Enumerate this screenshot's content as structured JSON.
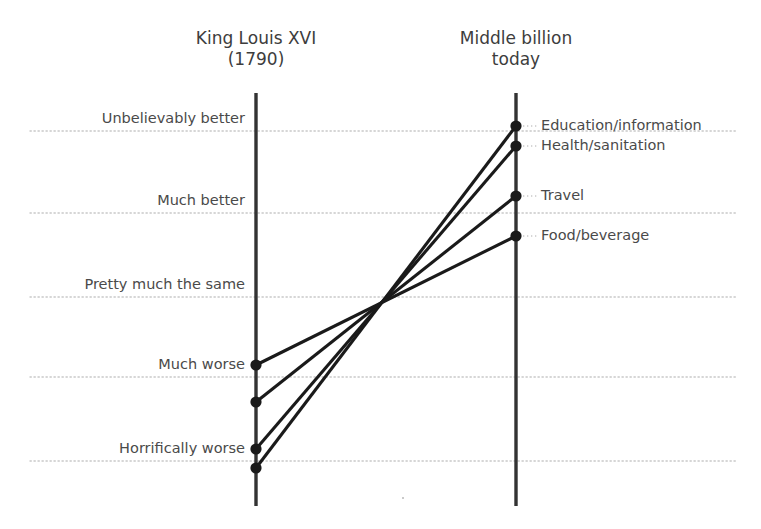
{
  "chart_data": {
    "type": "line",
    "subtype": "slopegraph",
    "title": "",
    "columns": [
      {
        "id": "left",
        "label": "King Louis XVI\n(1790)",
        "x": 256
      },
      {
        "id": "right",
        "label": "Middle billion\ntoday",
        "x": 516
      }
    ],
    "ylabel": "",
    "xlabel": "",
    "grid": true,
    "legend_position": "inline-right",
    "scale_labels": [
      {
        "label": "Unbelievably better",
        "value": 2,
        "y": 131
      },
      {
        "label": "Much better",
        "value": 1,
        "y": 213
      },
      {
        "label": "Pretty much the same",
        "value": 0,
        "y": 297
      },
      {
        "label": "Much worse",
        "value": -1,
        "y": 377
      },
      {
        "label": "Horrifically worse",
        "value": -2,
        "y": 461
      }
    ],
    "categories": [
      "King Louis XVI (1790)",
      "Middle billion today"
    ],
    "series": [
      {
        "name": "Education/information",
        "values": [
          -2.08,
          2.06
        ],
        "left_y": 468,
        "right_y": 126
      },
      {
        "name": "Health/sanitation",
        "values": [
          -1.9,
          1.82
        ],
        "left_y": 449,
        "right_y": 146
      },
      {
        "name": "Travel",
        "values": [
          -1.32,
          1.21
        ],
        "left_y": 402,
        "right_y": 196
      },
      {
        "name": "Food/beverage",
        "values": [
          -0.85,
          0.73
        ],
        "left_y": 365,
        "right_y": 236
      }
    ],
    "colors": {
      "line": "#1a1a1a",
      "axis": "#333333",
      "gridline": "#c9c9c9",
      "text": "#4a4a4a",
      "background": "#ffffff"
    }
  }
}
